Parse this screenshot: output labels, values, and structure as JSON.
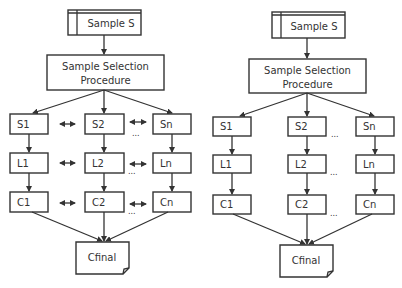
{
  "diagrams": [
    {
      "id": "left",
      "source": "Sample S",
      "procedure": [
        "Sample Selection",
        "Procedure"
      ],
      "row_s": [
        "S1",
        "S2",
        "Sn"
      ],
      "row_l": [
        "L1",
        "L2",
        "Ln"
      ],
      "row_c": [
        "C1",
        "C2",
        "Cn"
      ],
      "final": "Cfinal",
      "ellipsis": "...",
      "has_bidirectional_links": true
    },
    {
      "id": "right",
      "source": "Sample S",
      "procedure": [
        "Sample Selection",
        "Procedure"
      ],
      "row_s": [
        "S1",
        "S2",
        "Sn"
      ],
      "row_l": [
        "L1",
        "L2",
        "Ln"
      ],
      "row_c": [
        "C1",
        "C2",
        "Cn"
      ],
      "final": "Cfinal",
      "ellipsis": "...",
      "has_bidirectional_links": false
    }
  ],
  "colors": {
    "stroke": "#333333",
    "background": "#ffffff"
  }
}
